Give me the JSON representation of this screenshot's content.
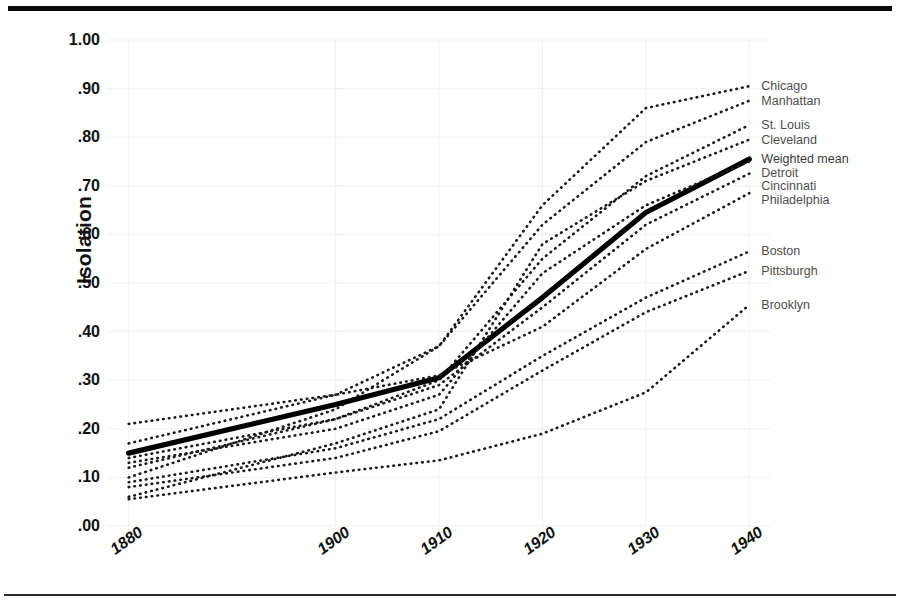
{
  "chart_data": {
    "type": "line",
    "title": "",
    "xlabel": "",
    "ylabel": "Isolation",
    "x": [
      1880,
      1900,
      1910,
      1920,
      1930,
      1940
    ],
    "xtick_labels": [
      "1880",
      "1900",
      "1910",
      "1920",
      "1930",
      "1940"
    ],
    "ytick_labels": [
      "1.00",
      ".90",
      ".80",
      ".70",
      ".60",
      ".50",
      ".40",
      ".30",
      ".20",
      ".10",
      ".00"
    ],
    "ylim": [
      0.0,
      1.0
    ],
    "ytick_values": [
      1.0,
      0.9,
      0.8,
      0.7,
      0.6,
      0.5,
      0.4,
      0.3,
      0.2,
      0.1,
      0.0
    ],
    "grid": true,
    "legend_position": "right-of-plot-inline",
    "series": [
      {
        "name": "Chicago",
        "style": "dotted",
        "values": [
          0.1,
          0.24,
          0.37,
          0.66,
          0.86,
          0.905
        ]
      },
      {
        "name": "Manhattan",
        "style": "dotted",
        "values": [
          0.21,
          0.27,
          0.37,
          0.62,
          0.79,
          0.875
        ]
      },
      {
        "name": "St. Louis",
        "style": "dotted",
        "values": [
          0.12,
          0.22,
          0.3,
          0.55,
          0.72,
          0.825
        ]
      },
      {
        "name": "Cleveland",
        "style": "dotted",
        "values": [
          0.06,
          0.17,
          0.24,
          0.58,
          0.71,
          0.795
        ]
      },
      {
        "name": "Weighted mean",
        "style": "solid",
        "values": [
          0.15,
          0.25,
          0.305,
          0.47,
          0.645,
          0.755
        ]
      },
      {
        "name": "Detroit",
        "style": "dotted",
        "values": [
          0.13,
          0.2,
          0.27,
          0.52,
          0.66,
          0.75
        ]
      },
      {
        "name": "Cincinnati",
        "style": "dotted",
        "values": [
          0.14,
          0.22,
          0.29,
          0.45,
          0.62,
          0.725
        ]
      },
      {
        "name": "Philadelphia",
        "style": "dotted",
        "values": [
          0.17,
          0.27,
          0.31,
          0.41,
          0.57,
          0.685
        ]
      },
      {
        "name": "Boston",
        "style": "dotted",
        "values": [
          0.09,
          0.16,
          0.22,
          0.35,
          0.47,
          0.565
        ]
      },
      {
        "name": "Pittsburgh",
        "style": "dotted",
        "values": [
          0.08,
          0.14,
          0.195,
          0.32,
          0.44,
          0.525
        ]
      },
      {
        "name": "Brooklyn",
        "style": "dotted",
        "values": [
          0.055,
          0.11,
          0.135,
          0.19,
          0.275,
          0.455
        ]
      }
    ]
  }
}
